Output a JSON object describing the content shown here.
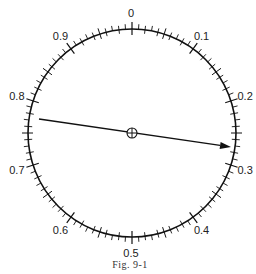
{
  "figure": {
    "caption": "Fig. 9-1",
    "dial": {
      "center": [
        132,
        133
      ],
      "radius": 104,
      "divisions": 100,
      "labels": [
        {
          "value": 0.0,
          "text": "0"
        },
        {
          "value": 0.1,
          "text": "0.1"
        },
        {
          "value": 0.2,
          "text": "0.2"
        },
        {
          "value": 0.3,
          "text": "0.3"
        },
        {
          "value": 0.4,
          "text": "0.4"
        },
        {
          "value": 0.5,
          "text": "0.5"
        },
        {
          "value": 0.6,
          "text": "0.6"
        },
        {
          "value": 0.7,
          "text": "0.7"
        },
        {
          "value": 0.8,
          "text": "0.8"
        },
        {
          "value": 0.9,
          "text": "0.9"
        }
      ]
    },
    "pointer": {
      "tail": [
        39,
        119
      ],
      "tip": [
        231,
        147
      ],
      "pivot_symbol": "crossed-circle"
    },
    "colors": {
      "stroke": "#111111",
      "background": "#ffffff"
    }
  }
}
